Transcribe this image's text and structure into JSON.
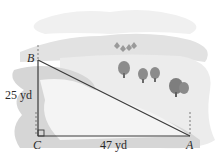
{
  "diagram": {
    "type": "right-triangle-word-problem",
    "vertices": [
      {
        "name": "B",
        "x": 38,
        "y": 60
      },
      {
        "name": "C",
        "x": 38,
        "y": 136
      },
      {
        "name": "A",
        "x": 190,
        "y": 136
      }
    ],
    "labels": {
      "B": "B",
      "C": "C",
      "A": "A",
      "side_BC": "25 yd",
      "side_CA": "47 yd"
    },
    "right_angle_at": "C",
    "colors": {
      "line": "#3a3a3a",
      "sky": "#f2f2f2",
      "hill": "#dcdcdc",
      "water": "#cfcfcf",
      "trees": "#8a8a8a",
      "text": "#2a2a2a"
    }
  }
}
